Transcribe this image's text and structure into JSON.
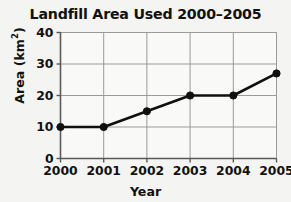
{
  "chart_data": {
    "type": "line",
    "title": "Landfill Area Used 2000–2005",
    "xlabel": "Year",
    "ylabel": "Area (km²)",
    "ylabel_base": "Area (km",
    "ylabel_sup": "2",
    "ylabel_tail": ")",
    "categories": [
      "2000",
      "2001",
      "2002",
      "2003",
      "2004",
      "2005"
    ],
    "x": [
      2000,
      2001,
      2002,
      2003,
      2004,
      2005
    ],
    "values": [
      10,
      10,
      15,
      20,
      20,
      27
    ],
    "series": [
      {
        "name": "Landfill area used",
        "values": [
          10,
          10,
          15,
          20,
          20,
          27
        ]
      }
    ],
    "ylim": [
      0,
      40
    ],
    "yticks": [
      0,
      10,
      20,
      30,
      40
    ],
    "ytick_labels": [
      "0",
      "10",
      "20",
      "30",
      "40"
    ],
    "xtick_labels": [
      "2000",
      "2001",
      "2002",
      "2003",
      "2004",
      "2005"
    ],
    "grid": true,
    "grid_axis": "both",
    "legend": false,
    "legend_position": "none",
    "line_color": "#101010",
    "marker": "circle",
    "marker_color": "#101010",
    "grid_color": "#9a9a9a",
    "axis_color": "#5a5a5a",
    "background_color": "#f4f4f2",
    "text_color": "#111111"
  }
}
